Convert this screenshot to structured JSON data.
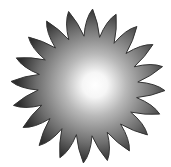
{
  "image": {
    "subject": "sun",
    "icon": "sun-icon",
    "ray_count": 20,
    "colors": {
      "background": "#ffffff",
      "edge": "#3a3a3a",
      "mid": "#8a8a8a",
      "glow": "#ffffff"
    }
  }
}
